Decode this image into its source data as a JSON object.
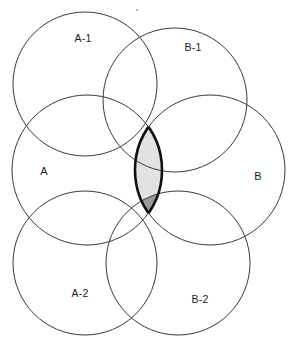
{
  "diagram": {
    "type": "venn",
    "background_color": "#ffffff",
    "stroke_color": "#3a3a3a",
    "lens_outline_color": "#111111",
    "lens_fill_color": "#e2e2e2",
    "dark_fill_color": "#9a9a9a",
    "label_color": "#1a1a1a",
    "circles": [
      {
        "id": "A",
        "label": "A",
        "cx": 87,
        "cy": 170,
        "r": 75,
        "label_x": 44,
        "label_y": 172
      },
      {
        "id": "B",
        "label": "B",
        "cx": 210,
        "cy": 170,
        "r": 75,
        "label_x": 258,
        "label_y": 177
      },
      {
        "id": "A-1",
        "label": "A-1",
        "cx": 85,
        "cy": 84,
        "r": 72,
        "label_x": 83,
        "label_y": 39
      },
      {
        "id": "B-1",
        "label": "B-1",
        "cx": 175,
        "cy": 100,
        "r": 72,
        "label_x": 193,
        "label_y": 48
      },
      {
        "id": "A-2",
        "label": "A-2",
        "cx": 85,
        "cy": 263,
        "r": 72,
        "label_x": 80,
        "label_y": 294
      },
      {
        "id": "B-2",
        "label": "B-2",
        "cx": 178,
        "cy": 263,
        "r": 72,
        "label_x": 200,
        "label_y": 300
      }
    ],
    "highlighted_regions": [
      {
        "id": "lens-AB",
        "description": "A intersect B",
        "fill": "#e2e2e2",
        "outlined": true
      },
      {
        "id": "dark-upper",
        "description": "A intersect B intersect A-1",
        "fill": "#9a9a9a",
        "outlined": false
      },
      {
        "id": "dark-lower",
        "description": "A intersect B intersect B-2",
        "fill": "#9a9a9a",
        "outlined": false
      }
    ],
    "lens_geometry": {
      "top_vertex_x": 148,
      "top_vertex_y": 77,
      "bottom_vertex_x": 148,
      "bottom_vertex_y": 250,
      "left_edge_x": 90,
      "right_edge_x": 206,
      "center_x": 148,
      "center_y": 163
    }
  }
}
